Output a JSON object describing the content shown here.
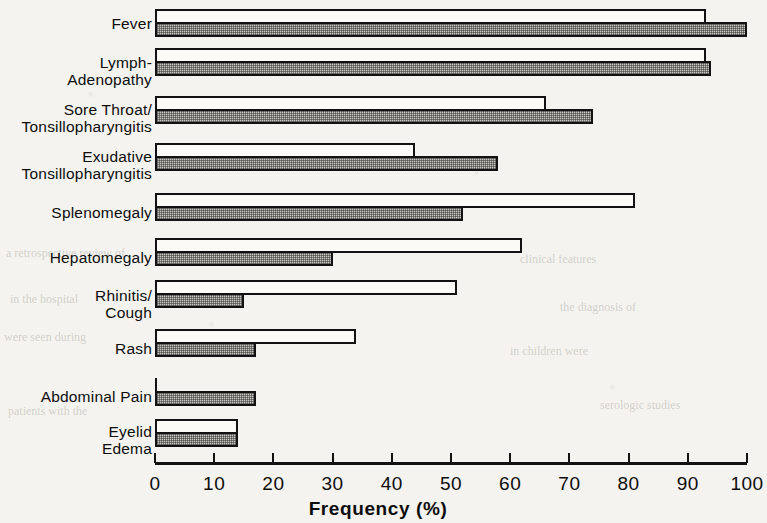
{
  "chart_data": {
    "type": "bar",
    "orientation": "horizontal",
    "title": "",
    "xlabel": "Frequency (%)",
    "ylabel": "",
    "xlim": [
      0,
      100
    ],
    "xticks": [
      0,
      10,
      20,
      30,
      40,
      50,
      60,
      70,
      80,
      90,
      100
    ],
    "xtick_labels": [
      "0",
      "10",
      "20",
      "30",
      "40",
      "50",
      "60",
      "70",
      "80",
      "90",
      "100"
    ],
    "grid": false,
    "legend": null,
    "categories": [
      "Fever",
      "Lymph-\nAdenopathy",
      "Sore Throat/\nTonsillopharyngitis",
      "Exudative\nTonsillopharyngitis",
      "Splenomegaly",
      "Hepatomegaly",
      "Rhinitis/\nCough",
      "Rash",
      "Abdominal Pain",
      "Eyelid\nEdema"
    ],
    "series": [
      {
        "name": "open",
        "style": "white",
        "values": [
          93,
          93,
          66,
          44,
          81,
          62,
          51,
          34,
          0,
          14
        ]
      },
      {
        "name": "hatched",
        "style": "shaded",
        "values": [
          100,
          94,
          74,
          58,
          52,
          30,
          15,
          17,
          17,
          14
        ]
      }
    ]
  },
  "axis": {
    "title": "Frequency (%)"
  },
  "marginalia": {
    "ghost_lines": [
      "a retrospective review of",
      "in the hospital",
      "were seen during",
      "patients with the",
      "clinical features",
      "the diagnosis of",
      "in children were",
      "serologic studies"
    ]
  }
}
